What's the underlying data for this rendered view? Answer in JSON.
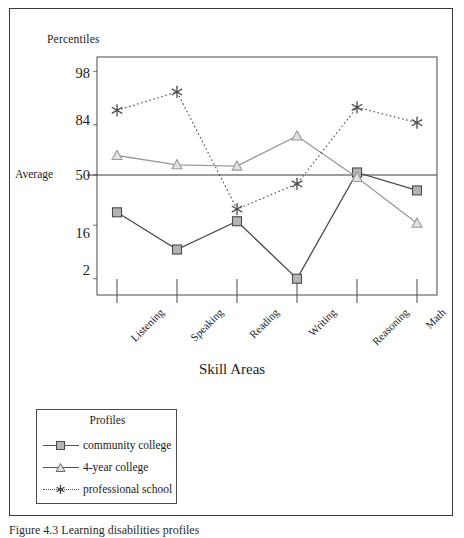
{
  "figure": {
    "caption": "Figure 4.3   Learning disabilities profiles"
  },
  "chart_data": {
    "type": "line",
    "title": "",
    "xlabel": "Skill Areas",
    "ylabel": "Percentiles",
    "average_label": "Average",
    "average_value": 50,
    "grid": false,
    "legend_position": "below-left",
    "legend_title": "Profiles",
    "categories": [
      "Listening",
      "Speaking",
      "Reading",
      "Writing",
      "Reasoning",
      "Math"
    ],
    "y_ticks": [
      98,
      84,
      50,
      16,
      2
    ],
    "y_tick_labels": [
      "98",
      "84",
      "50",
      "16",
      "2"
    ],
    "ylim": [
      0.5,
      99.5
    ],
    "y_scale": "normal-curve-equivalent",
    "series": [
      {
        "name": "community college",
        "marker": "square",
        "line_style": "solid",
        "color": "#4a4a4a",
        "marker_fill": "#b4b4b4",
        "values": [
          23,
          7,
          18,
          2,
          52,
          38
        ]
      },
      {
        "name": "4-year college",
        "marker": "triangle",
        "line_style": "solid",
        "color": "#9a9a9a",
        "marker_fill": "#e2e2e2",
        "values": [
          65,
          58,
          57,
          78,
          48,
          17
        ]
      },
      {
        "name": "professional school",
        "marker": "asterisk",
        "line_style": "dotted",
        "color": "#4a4a4a",
        "marker_fill": "#4a4a4a",
        "values": [
          90,
          95,
          25,
          43,
          91,
          85
        ]
      }
    ]
  }
}
